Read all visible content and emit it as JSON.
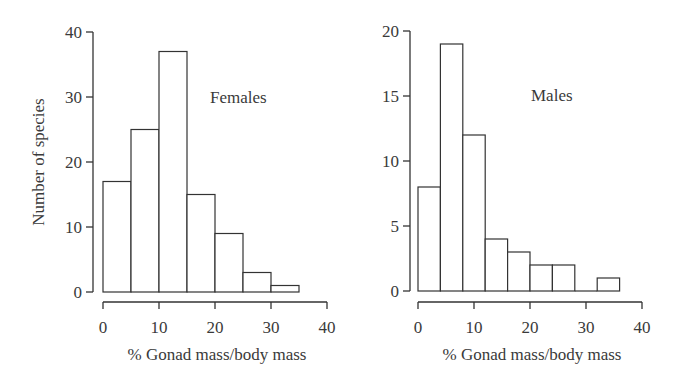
{
  "chart_data": [
    {
      "type": "bar",
      "title": "Females",
      "panel_label": "Females",
      "xlabel": "% Gonad mass/body mass",
      "ylabel": "Number of species",
      "bin_edges": [
        0,
        5,
        10,
        15,
        20,
        25,
        30,
        35
      ],
      "categories": [
        "0-5",
        "5-10",
        "10-15",
        "15-20",
        "20-25",
        "25-30",
        "30-35"
      ],
      "values": [
        17,
        25,
        37,
        15,
        9,
        3,
        1
      ],
      "xlim": [
        0,
        40
      ],
      "ylim": [
        0,
        40
      ],
      "xticks": [
        0,
        10,
        20,
        30,
        40
      ],
      "yticks": [
        0,
        10,
        20,
        30,
        40
      ],
      "grid": false
    },
    {
      "type": "bar",
      "title": "Males",
      "panel_label": "Males",
      "xlabel": "% Gonad mass/body mass",
      "ylabel": "",
      "bin_edges": [
        0,
        4,
        8,
        12,
        16,
        20,
        24,
        28,
        32,
        36
      ],
      "categories": [
        "0-4",
        "4-8",
        "8-12",
        "12-16",
        "16-20",
        "20-24",
        "24-28",
        "28-32",
        "32-36"
      ],
      "values": [
        8,
        19,
        12,
        4,
        3,
        2,
        2,
        0,
        1
      ],
      "xlim": [
        0,
        40
      ],
      "ylim": [
        0,
        20
      ],
      "xticks": [
        0,
        10,
        20,
        30,
        40
      ],
      "yticks": [
        0,
        5,
        10,
        15,
        20
      ],
      "grid": false
    }
  ],
  "colors": {
    "stroke": "#333333",
    "fill": "#ffffff",
    "text": "#3a3a3a"
  }
}
